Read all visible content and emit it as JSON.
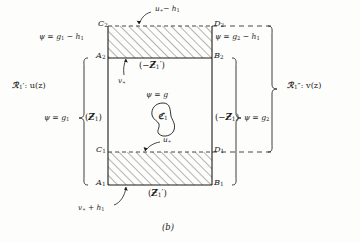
{
  "figure": {
    "caption": "(b)",
    "type": "mathematical-region-diagram"
  },
  "colors": {
    "ink": "#1a1a1a",
    "hatch": "#3a3a3a",
    "paper": "#fdfdfb"
  },
  "corner_labels": {
    "c2": "C",
    "c2_sub": "2",
    "d2": "D",
    "d2_sub": "2",
    "a2": "A",
    "a2_sub": "2",
    "b2": "B",
    "b2_sub": "2",
    "c1": "C",
    "c1_sub": "1",
    "d1": "D",
    "d1_sub": "1",
    "a1": "A",
    "a1_sub": "1",
    "b1": "B",
    "b1_sub": "1"
  },
  "boundary_conditions": {
    "top_left": {
      "lhs": "ψ =",
      "rhs": "g",
      "rhs_sub": "1",
      "tail": "− h",
      "tail_sub": "1"
    },
    "top_right": {
      "lhs": "ψ =",
      "rhs": "g",
      "rhs_sub": "2",
      "tail": "− h",
      "tail_sub": "1"
    },
    "left": {
      "lhs": "ψ =",
      "rhs": "g",
      "rhs_sub": "1"
    },
    "right": {
      "lhs": "ψ =",
      "rhs": "g",
      "rhs_sub": "2"
    },
    "center": {
      "lhs": "ψ =",
      "rhs": "g"
    }
  },
  "operator_labels": {
    "top_strip": {
      "open": "(−",
      "glyph": "Ƶ",
      "sub": "1",
      "prime": "′",
      "close": ")"
    },
    "left_side": {
      "open": "(",
      "glyph": "Ƶ",
      "sub": "1",
      "prime": "",
      "close": ")"
    },
    "right_side": {
      "open": "(−",
      "glyph": "Ƶ",
      "sub": "1",
      "prime": "",
      "close": ")"
    },
    "bottom_strip": {
      "open": "(",
      "glyph": "Ƶ",
      "sub": "1",
      "prime": "′",
      "close": ")"
    }
  },
  "region_labels": {
    "left_outer": {
      "glyph": "ℛ",
      "sub": "1",
      "prime": "′",
      "sep": ": u(z)"
    },
    "right_outer": {
      "glyph": "ℛ",
      "sub": "1",
      "prime": "″",
      "sep": ": v(z)"
    }
  },
  "arrow_labels": {
    "top": {
      "base": "u",
      "star": "∗",
      "op": "− h",
      "op_sub": "1"
    },
    "inner_top": {
      "base": "v",
      "star": "∗"
    },
    "inner_bottom": {
      "base": "u",
      "star": "∗"
    },
    "bottom": {
      "base": "v",
      "star": "∗",
      "op": "+ h",
      "op_sub": "1"
    }
  },
  "curve_label": {
    "glyph": "ℭ",
    "sub": "1"
  },
  "geometry": {
    "rect_left": 108,
    "rect_right": 212,
    "y_c2": 26,
    "y_a2": 58,
    "y_c1": 152,
    "y_a1": 185
  }
}
